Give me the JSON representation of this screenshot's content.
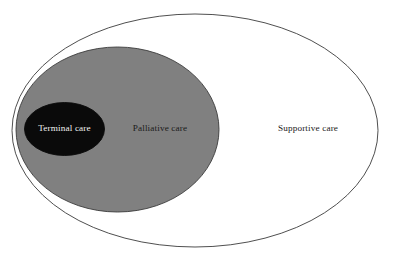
{
  "diagram": {
    "type": "nested-ellipse-venn",
    "background_color": "#ffffff",
    "canvas": {
      "width": 400,
      "height": 260
    },
    "regions": [
      {
        "id": "supportive",
        "label": "Supportive care",
        "fill_color": "#ffffff",
        "stroke_color": "#3b3b3b",
        "stroke_width": 0.9,
        "text_color": "#1a1a1a",
        "nesting_level": 1,
        "geometry": {
          "cx": 195,
          "cy": 130.5,
          "rx": 183,
          "ry": 116.5
        },
        "label_position": {
          "x": 308,
          "y": 129
        }
      },
      {
        "id": "palliative",
        "label": "Palliative care",
        "fill_color": "#808080",
        "stroke_color": "#3b3b3b",
        "stroke_width": 0.9,
        "text_color": "#1a1a1a",
        "nesting_level": 2,
        "geometry": {
          "cx": 117.5,
          "cy": 129.5,
          "rx": 101.5,
          "ry": 82.5
        },
        "label_position": {
          "x": 160,
          "y": 129
        }
      },
      {
        "id": "terminal",
        "label": "Terminal care",
        "fill_color": "#0a0a0a",
        "stroke_color": "#0a0a0a",
        "stroke_width": 0.9,
        "text_color": "#f2f2f2",
        "nesting_level": 3,
        "geometry": {
          "cx": 64.5,
          "cy": 129,
          "rx": 40,
          "ry": 26.5
        },
        "label_position": {
          "x": 64.5,
          "y": 129
        }
      }
    ]
  }
}
